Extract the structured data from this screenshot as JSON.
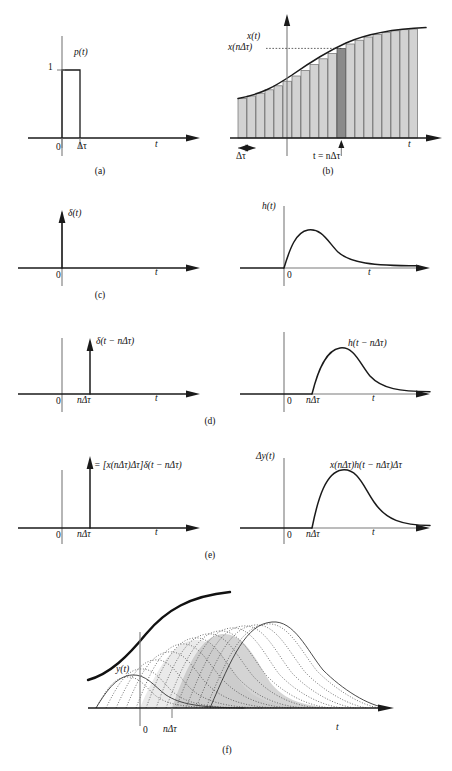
{
  "figure": {
    "width": 452,
    "height": 771,
    "background": "#ffffff",
    "ink": "#1a1a1a",
    "bar_fill": "#d2d2d2",
    "bar_highlight_fill": "#8a8a8a",
    "shade_fill": "#b9b9b9"
  },
  "axis_labels": {
    "t": "t",
    "zero": "0",
    "one": "1",
    "delta_tau": "Δτ",
    "n_delta_tau": "nΔτ",
    "t_equals_n_delta_tau": "t = nΔτ"
  },
  "panels": [
    {
      "id": "a",
      "letter": "(a)",
      "signal_label": "p(t)",
      "kind": "rect-pulse",
      "description": "Unit-height rectangular pulse of width delta-tau starting at t = 0",
      "height_label": "1",
      "width_label": "Δτ"
    },
    {
      "id": "b",
      "letter": "(b)",
      "signal_label": "x(t)",
      "sample_label": "x(nΔτ)",
      "kind": "staircase-approximation",
      "description": "Signal x(t) approximated by contiguous rectangular strips of width delta-tau; the strip at t = n delta-tau is highlighted",
      "strip_width_label": "Δτ",
      "marker_label": "t = nΔτ",
      "n_strips": 22,
      "highlight_index": 11
    },
    {
      "id": "c",
      "letter": "(c)",
      "left": {
        "signal_label": "δ(t)",
        "kind": "impulse",
        "location_label": "0",
        "description": "Unit impulse at the origin"
      },
      "right": {
        "signal_label": "h(t)",
        "kind": "impulse-response",
        "location_label": "0",
        "description": "Impulse response h(t) rising from zero, peaking, then decaying"
      }
    },
    {
      "id": "d",
      "letter": "(d)",
      "left": {
        "signal_label": "δ(t − nΔτ)",
        "kind": "impulse",
        "location_label": "nΔτ",
        "description": "Unit impulse delayed to t = n delta-tau"
      },
      "right": {
        "signal_label": "h(t − nΔτ)",
        "kind": "impulse-response",
        "location_label": "nΔτ",
        "description": "Impulse response delayed to start at t = n delta-tau"
      }
    },
    {
      "id": "e",
      "letter": "(e)",
      "left": {
        "signal_label": "= [x(nΔτ)Δτ]δ(t − nΔτ)",
        "kind": "scaled-impulse",
        "location_label": "nΔτ",
        "description": "Impulse of strength x(n delta-tau) delta-tau located at t = n delta-tau"
      },
      "right": {
        "axis_label": "Δy(t)",
        "signal_label": "x(nΔτ)h(t − nΔτ)Δτ",
        "kind": "scaled-impulse-response",
        "location_label": "nΔτ",
        "description": "Scaled and delayed impulse response contributing an increment of output"
      }
    },
    {
      "id": "f",
      "letter": "(f)",
      "signal_label": "y(t)",
      "location_label": "nΔτ",
      "kind": "superposition",
      "description": "Sum of all scaled and delayed impulse responses builds up the output y(t)",
      "n_components": 13
    }
  ]
}
